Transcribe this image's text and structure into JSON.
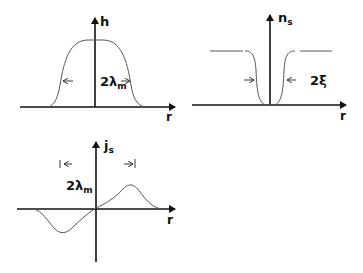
{
  "panels": {
    "h": {
      "y_label": "h",
      "x_label": "r",
      "annotation_main": "2λ",
      "annotation_sub": "m"
    },
    "ns": {
      "y_label_main": "n",
      "y_label_sub": "s",
      "x_label": "r",
      "annotation": "2ξ"
    },
    "js": {
      "y_label_main": "j",
      "y_label_sub": "s",
      "x_label": "r",
      "annotation_main": "2λ",
      "annotation_sub": "m"
    }
  },
  "colors": {
    "axis": "#111111",
    "curve": "#555555",
    "background": "#ffffff"
  }
}
